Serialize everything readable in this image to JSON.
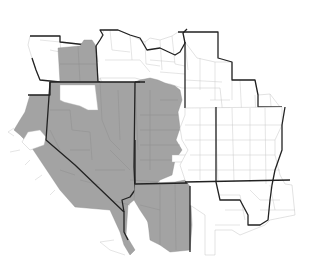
{
  "map": {
    "type": "choropleth",
    "region": "Western United States",
    "colors": {
      "background": "#ffffff",
      "shaded_counties": "#a3a3a3",
      "unshaded_counties": "#ffffff",
      "state_borders": "#222222",
      "county_borders": "#c4c4c4"
    },
    "legend": null,
    "labels": []
  }
}
